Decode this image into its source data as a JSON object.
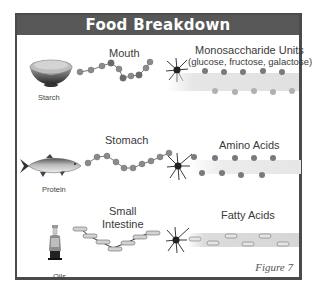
{
  "title": "Food Breakdown",
  "rows": [
    {
      "food_label": "Starch",
      "food_icon": "rice-bowl-icon",
      "organ_label": "Mouth",
      "product_label": "Monosaccharide Units",
      "product_sublabel": "(glucose, fructose, galactose)"
    },
    {
      "food_label": "Protein",
      "food_icon": "fish-icon",
      "organ_label": "Stomach",
      "product_label": "Amino Acids"
    },
    {
      "food_label": "Oils",
      "food_icon": "oil-bottle-icon",
      "organ_label_line1": "Small",
      "organ_label_line2": "Intestine",
      "product_label": "Fatty Acids"
    }
  ],
  "caption": "Figure 7",
  "colors": {
    "header_bg": "#575757",
    "frame_border": "#4a4a4a",
    "molecule": "#8a8a8a",
    "band": "#e6e6e6"
  }
}
